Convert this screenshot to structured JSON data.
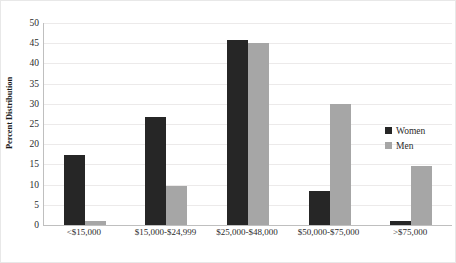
{
  "chart_data": {
    "type": "bar",
    "title": "",
    "xlabel": "",
    "ylabel": "Percent Distribution",
    "ylim": [
      0,
      50
    ],
    "yticks": [
      50,
      45,
      40,
      35,
      30,
      25,
      20,
      15,
      10,
      5,
      0
    ],
    "grid": true,
    "legend_position": "right-inside",
    "categories": [
      "<$15,000",
      "$15,000-$24,999",
      "$25,000-$48,000",
      "$50,000-$75,000",
      ">$75,000"
    ],
    "series": [
      {
        "name": "Women",
        "color": "#262626",
        "values": [
          17.3,
          26.8,
          45.8,
          8.4,
          1.1
        ]
      },
      {
        "name": "Men",
        "color": "#a6a6a6",
        "values": [
          1.1,
          9.7,
          45.1,
          30.0,
          14.7
        ]
      }
    ]
  }
}
